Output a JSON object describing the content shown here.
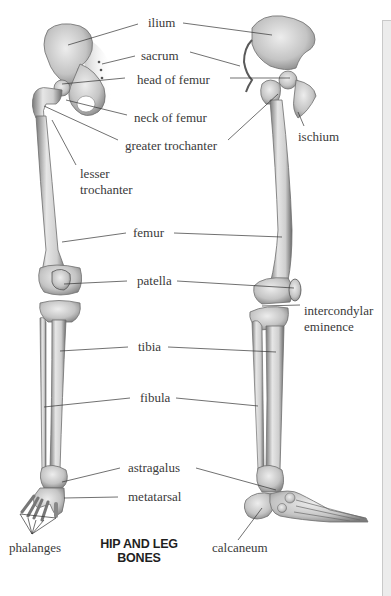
{
  "figure": {
    "title_line1": "HIP AND LEG",
    "title_line2": "BONES"
  },
  "labels": {
    "ilium": "ilium",
    "sacrum": "sacrum",
    "head_of_femur": "head of femur",
    "neck_of_femur": "neck of femur",
    "greater_trochanter": "greater trochanter",
    "ischium": "ischium",
    "lesser_trochanter_1": "lesser",
    "lesser_trochanter_2": "trochanter",
    "femur": "femur",
    "patella": "patella",
    "intercondylar_1": "intercondylar",
    "intercondylar_2": "eminence",
    "tibia": "tibia",
    "fibula": "fibula",
    "astragalus": "astragalus",
    "metatarsal": "metatarsal",
    "phalanges": "phalanges",
    "calcaneum": "calcaneum"
  },
  "colors": {
    "bone_light": "#e8e8e8",
    "bone_mid": "#b5b5b5",
    "bone_dark": "#6e6e6e",
    "leader_line": "#333333",
    "label_text": "#3a3a3a",
    "panel": "#ececec"
  }
}
